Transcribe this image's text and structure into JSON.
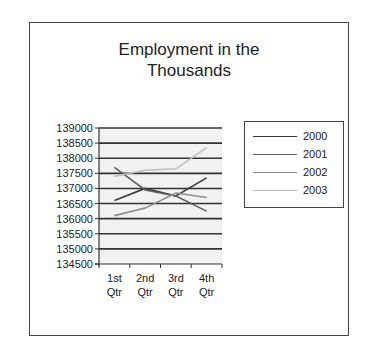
{
  "chart_data": {
    "type": "line",
    "title": "Employment in the Thousands",
    "title_lines": [
      "Employment in the",
      "Thousands"
    ],
    "xlabel": "",
    "ylabel": "",
    "categories": [
      "1st Qtr",
      "2nd Qtr",
      "3rd Qtr",
      "4th Qtr"
    ],
    "category_lines": [
      [
        "1st",
        "Qtr"
      ],
      [
        "2nd",
        "Qtr"
      ],
      [
        "3rd",
        "Qtr"
      ],
      [
        "4th",
        "Qtr"
      ]
    ],
    "ylim": [
      134500,
      139000
    ],
    "yticks": [
      134500,
      135000,
      135500,
      136000,
      136500,
      137000,
      137500,
      138000,
      138500,
      139000
    ],
    "grid": true,
    "legend_position": "right",
    "series": [
      {
        "name": "2000",
        "color": "#3a3a3a",
        "values": [
          136600,
          137000,
          136750,
          137350
        ]
      },
      {
        "name": "2001",
        "color": "#5e5e5e",
        "values": [
          137700,
          136950,
          136750,
          136250
        ]
      },
      {
        "name": "2002",
        "color": "#8c8c8c",
        "values": [
          136100,
          136350,
          136850,
          136700
        ]
      },
      {
        "name": "2003",
        "color": "#bdbdbd",
        "values": [
          137400,
          137600,
          137650,
          138350
        ]
      }
    ]
  }
}
